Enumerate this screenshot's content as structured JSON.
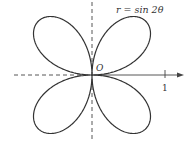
{
  "diagram": {
    "equation_label": "r = sin 2θ",
    "origin_label": "O",
    "tick_label": "1",
    "curve": {
      "type": "polar-rose",
      "function": "sin(2θ)",
      "petals": 4
    },
    "colors": {
      "curve": "#333333",
      "axes": "#444444"
    }
  },
  "chart_data": {
    "type": "line",
    "title": "r = sin 2θ",
    "xlabel": "",
    "ylabel": "",
    "annotations": [
      "O",
      "1"
    ],
    "x_ticks": [
      1
    ],
    "axis_style": {
      "negative_x": "dashed",
      "y_axis": "dashed",
      "positive_x": "solid-arrow"
    }
  }
}
